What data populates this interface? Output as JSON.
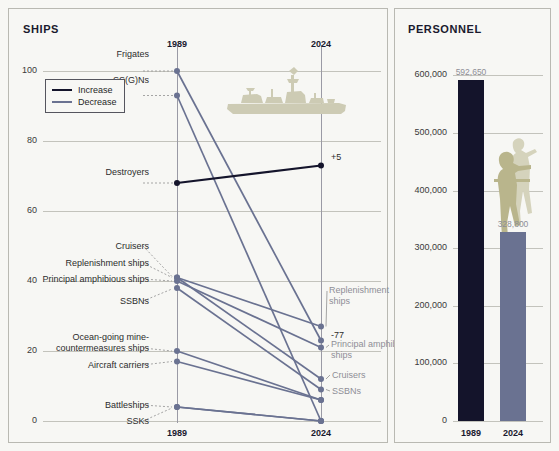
{
  "ships": {
    "title": "SHIPS",
    "legend": [
      {
        "label": "Increase",
        "color": "#14142b"
      },
      {
        "label": "Decrease",
        "color": "#6a7291"
      }
    ],
    "icon": "warship-silhouette-icon",
    "axis": {
      "yticks": [
        "100",
        "80",
        "60",
        "40",
        "20",
        "0"
      ],
      "ytick_values": [
        100,
        80,
        60,
        40,
        20,
        0
      ],
      "ymin": 0,
      "ymax": 104,
      "xticks": [
        "1989",
        "2024"
      ],
      "xtop": [
        "1989",
        "2024"
      ]
    },
    "annotations": [
      {
        "text": "+5",
        "series": "Destroyers"
      },
      {
        "text": "-77",
        "series": "Frigates"
      }
    ],
    "left_labels": [
      {
        "text": "Frigates"
      },
      {
        "text": "SS(G)Ns"
      },
      {
        "text": "Destroyers"
      },
      {
        "text": "Cruisers"
      },
      {
        "text": "Replenishment ships"
      },
      {
        "text": "Principal amphibious ships"
      },
      {
        "text": "SSBNs"
      },
      {
        "text": "Ocean-going mine-"
      },
      {
        "text": "countermeasures ships"
      },
      {
        "text": "Aircraft carriers"
      },
      {
        "text": "Battleships"
      },
      {
        "text": "SSKs"
      }
    ],
    "right_labels": [
      {
        "text": "Replenishment"
      },
      {
        "text": "ships"
      },
      {
        "text": "Principal amphibious"
      },
      {
        "text": "ships"
      },
      {
        "text": "Cruisers"
      },
      {
        "text": "SSBNs"
      }
    ]
  },
  "personnel": {
    "title": "PERSONNEL",
    "icon": "soldier-silhouette-icon",
    "axis": {
      "yticks": [
        "600,000",
        "500,000",
        "400,000",
        "300,000",
        "200,000",
        "100,000",
        "0"
      ],
      "ytick_values": [
        600000,
        500000,
        400000,
        300000,
        200000,
        100000,
        0
      ],
      "ymin": 0,
      "ymax": 632000,
      "xticks": [
        "1989",
        "2024"
      ]
    },
    "bars": [
      {
        "label": "1989",
        "value": 592650,
        "value_label": "592,650",
        "color": "#14142b"
      },
      {
        "label": "2024",
        "value": 328800,
        "value_label": "328,800",
        "color": "#6a7291"
      }
    ]
  },
  "chart_data": [
    {
      "type": "line",
      "title": "SHIPS",
      "xlabel": "",
      "ylabel": "Ships",
      "x": [
        "1989",
        "2024"
      ],
      "ylim": [
        0,
        104
      ],
      "yticks": [
        0,
        20,
        40,
        60,
        80,
        100
      ],
      "grid": true,
      "legend": [
        "Increase",
        "Decrease"
      ],
      "legend_position": "upper-left",
      "series": [
        {
          "name": "Frigates",
          "values": [
            100,
            23
          ],
          "trend": "Decrease",
          "color": "#6a7291",
          "end_annotation": "-77"
        },
        {
          "name": "SS(G)Ns",
          "values": [
            93,
            0
          ],
          "trend": "Decrease",
          "color": "#6a7291"
        },
        {
          "name": "Destroyers",
          "values": [
            68,
            73
          ],
          "trend": "Increase",
          "color": "#14142b",
          "end_annotation": "+5"
        },
        {
          "name": "Cruisers",
          "values": [
            41,
            12
          ],
          "trend": "Decrease",
          "color": "#6a7291"
        },
        {
          "name": "Replenishment ships",
          "values": [
            41,
            27
          ],
          "trend": "Decrease",
          "color": "#6a7291"
        },
        {
          "name": "Principal amphibious ships",
          "values": [
            40,
            21
          ],
          "trend": "Decrease",
          "color": "#6a7291"
        },
        {
          "name": "SSBNs",
          "values": [
            38,
            9
          ],
          "trend": "Decrease",
          "color": "#6a7291"
        },
        {
          "name": "Ocean-going mine-countermeasures ships",
          "values": [
            20,
            6
          ],
          "trend": "Decrease",
          "color": "#6a7291"
        },
        {
          "name": "Aircraft carriers",
          "values": [
            17,
            6
          ],
          "trend": "Decrease",
          "color": "#6a7291"
        },
        {
          "name": "Battleships",
          "values": [
            4,
            0
          ],
          "trend": "Decrease",
          "color": "#6a7291"
        },
        {
          "name": "SSKs",
          "values": [
            4,
            0
          ],
          "trend": "Decrease",
          "color": "#6a7291"
        }
      ]
    },
    {
      "type": "bar",
      "title": "PERSONNEL",
      "xlabel": "",
      "ylabel": "Personnel",
      "categories": [
        "1989",
        "2024"
      ],
      "values": [
        592650,
        328800
      ],
      "value_labels": [
        "592,650",
        "328,800"
      ],
      "ylim": [
        0,
        632000
      ],
      "yticks": [
        0,
        100000,
        200000,
        300000,
        400000,
        500000,
        600000
      ],
      "grid": true,
      "colors": [
        "#14142b",
        "#6a7291"
      ]
    }
  ]
}
